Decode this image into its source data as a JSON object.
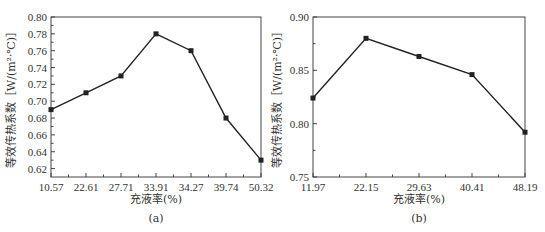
{
  "chart_data": [
    {
      "type": "line",
      "panel_label": "(a)",
      "title": "",
      "xlabel": "充液率(%)",
      "ylabel": "等效传热系数［W/(m²·℃)］",
      "categories": [
        "10.57",
        "22.61",
        "27.71",
        "33.91",
        "34.27",
        "39.74",
        "50.32"
      ],
      "values": [
        0.69,
        0.71,
        0.73,
        0.78,
        0.76,
        0.68,
        0.63
      ],
      "ylim": [
        0.61,
        0.8
      ],
      "yticks": [
        "0.62",
        "0.64",
        "0.66",
        "0.68",
        "0.70",
        "0.72",
        "0.74",
        "0.76",
        "0.78",
        "0.80"
      ],
      "grid": false,
      "marker": "square",
      "line_color": "#222222"
    },
    {
      "type": "line",
      "panel_label": "(b)",
      "title": "",
      "xlabel": "充液率(%)",
      "ylabel": "等效传热系数［W/(m²·℃)］",
      "categories": [
        "11.97",
        "22.15",
        "29.63",
        "40.41",
        "48.19"
      ],
      "values": [
        0.824,
        0.88,
        0.863,
        0.846,
        0.792
      ],
      "ylim": [
        0.75,
        0.9
      ],
      "yticks": [
        "0.75",
        "0.80",
        "0.85",
        "0.90"
      ],
      "grid": false,
      "marker": "square",
      "line_color": "#222222"
    }
  ]
}
